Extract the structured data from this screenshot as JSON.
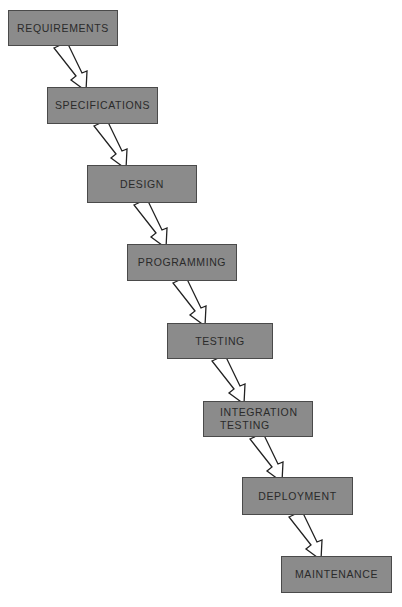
{
  "diagram": {
    "type": "waterfall-model",
    "colors": {
      "box_fill": "#8b8b8b",
      "box_border": "#4a4a4a",
      "text": "#2a2a2a",
      "arrow_fill": "#ffffff",
      "arrow_stroke": "#222222",
      "background": "#ffffff"
    },
    "stages": [
      {
        "label": "REQUIREMENTS",
        "x": 8,
        "y": 10,
        "w": 110,
        "h": 36
      },
      {
        "label": "SPECIFICATIONS",
        "x": 47,
        "y": 87,
        "w": 111,
        "h": 37
      },
      {
        "label": "DESIGN",
        "x": 87,
        "y": 165,
        "w": 110,
        "h": 38
      },
      {
        "label": "PROGRAMMING",
        "x": 127,
        "y": 244,
        "w": 110,
        "h": 37
      },
      {
        "label": "TESTING",
        "x": 167,
        "y": 323,
        "w": 106,
        "h": 36
      },
      {
        "label": "INTEGRATION\nTESTING",
        "x": 203,
        "y": 401,
        "w": 110,
        "h": 36
      },
      {
        "label": "DEPLOYMENT",
        "x": 242,
        "y": 477,
        "w": 111,
        "h": 38
      },
      {
        "label": "MAINTENANCE",
        "x": 281,
        "y": 556,
        "w": 111,
        "h": 37
      }
    ],
    "arrows": [
      {
        "from": "REQUIREMENTS",
        "to": "SPECIFICATIONS"
      },
      {
        "from": "SPECIFICATIONS",
        "to": "DESIGN"
      },
      {
        "from": "DESIGN",
        "to": "PROGRAMMING"
      },
      {
        "from": "PROGRAMMING",
        "to": "TESTING"
      },
      {
        "from": "TESTING",
        "to": "INTEGRATION TESTING"
      },
      {
        "from": "INTEGRATION TESTING",
        "to": "DEPLOYMENT"
      },
      {
        "from": "DEPLOYMENT",
        "to": "MAINTENANCE"
      }
    ]
  }
}
